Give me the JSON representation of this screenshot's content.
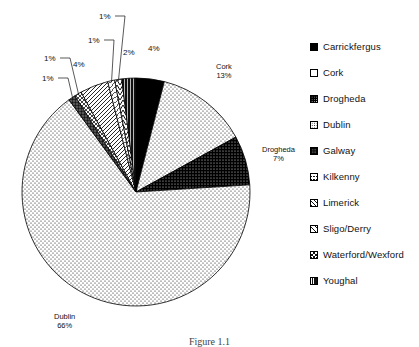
{
  "figure": {
    "caption": "Figure 1.1"
  },
  "chart_data": {
    "type": "pie",
    "title": "",
    "categories": [
      "Carrickfergus",
      "Cork",
      "Drogheda",
      "Dublin",
      "Galway",
      "Kilkenny",
      "Limerick",
      "Sligo/Derry",
      "Waterford/Wexford",
      "Youghal"
    ],
    "values": [
      4,
      13,
      7,
      66,
      1,
      1,
      4,
      1,
      1,
      2
    ],
    "value_labels": [
      "4%",
      "13%",
      "7%",
      "66%",
      "1%",
      "1%",
      "4%",
      "1%",
      "1%",
      "2%"
    ],
    "units": "percent",
    "legend_position": "right",
    "start_angle_deg": 0,
    "direction": "clockwise",
    "grid": false
  },
  "pie": {
    "center_x": 136,
    "center_y": 192,
    "radius": 114,
    "slices": [
      {
        "name": "Carrickfergus",
        "value": 4,
        "label": "4%",
        "pattern": "solid-black",
        "label_x": 148,
        "label_y": 44,
        "leader": false
      },
      {
        "name": "Cork",
        "value": 13,
        "label": "Cork\n13%",
        "pattern": "dots-light",
        "label_x": 216,
        "label_y": 62,
        "leader": false
      },
      {
        "name": "Drogheda",
        "value": 7,
        "label": "Drogheda\n7%",
        "pattern": "dots-dark",
        "label_x": 262,
        "label_y": 145,
        "leader": false
      },
      {
        "name": "Dublin",
        "value": 66,
        "label": "Dublin\n66%",
        "pattern": "dots-light",
        "label_x": 54,
        "label_y": 312,
        "leader": false
      },
      {
        "name": "Galway",
        "value": 1,
        "label": "1%",
        "pattern": "grid-dark",
        "label_x": 42,
        "label_y": 74,
        "leader": true
      },
      {
        "name": "Kilkenny",
        "value": 1,
        "label": "1%",
        "pattern": "crosshatch",
        "label_x": 44,
        "label_y": 54,
        "leader": true
      },
      {
        "name": "Limerick",
        "value": 4,
        "label": "4%",
        "pattern": "diag-hatch",
        "label_x": 73,
        "label_y": 60,
        "leader": false
      },
      {
        "name": "Sligo/Derry",
        "value": 1,
        "label": "1%",
        "pattern": "diag-light",
        "label_x": 88,
        "label_y": 36,
        "leader": true
      },
      {
        "name": "Waterford/Wexford",
        "value": 1,
        "label": "1%",
        "pattern": "chevron",
        "label_x": 99,
        "label_y": 12,
        "leader": true
      },
      {
        "name": "Youghal",
        "value": 2,
        "label": "2%",
        "pattern": "vert-dark",
        "label_x": 123,
        "label_y": 48,
        "leader": false
      }
    ]
  },
  "legend": {
    "items": [
      {
        "label": "Carrickfergus",
        "pattern": "solid-black"
      },
      {
        "label": "Cork",
        "pattern": "white"
      },
      {
        "label": "Drogheda",
        "pattern": "dots-dark"
      },
      {
        "label": "Dublin",
        "pattern": "dots-light"
      },
      {
        "label": "Galway",
        "pattern": "grid-dark"
      },
      {
        "label": "Kilkenny",
        "pattern": "crosshatch"
      },
      {
        "label": "Limerick",
        "pattern": "diag-hatch"
      },
      {
        "label": "Sligo/Derry",
        "pattern": "diag-light"
      },
      {
        "label": "Waterford/Wexford",
        "pattern": "chevron"
      },
      {
        "label": "Youghal",
        "pattern": "vert-dark"
      }
    ]
  },
  "colors": {
    "ink": "#111111",
    "background": "#ffffff",
    "outline": "#000000"
  }
}
